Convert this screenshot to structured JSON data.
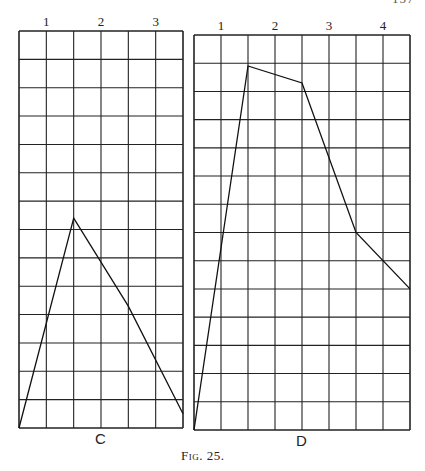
{
  "page": {
    "running_header_page_number": "157",
    "caption": "Fig. 25."
  },
  "chart_data": [
    {
      "type": "line",
      "title": "C",
      "xlabel": "",
      "ylabel": "",
      "grid": true,
      "grid_columns": 6,
      "grid_rows": 14,
      "x_tick_labels": [
        {
          "label": "1",
          "at": 1
        },
        {
          "label": "2",
          "at": 3
        },
        {
          "label": "3",
          "at": 5
        }
      ],
      "xlim": [
        0,
        6
      ],
      "ylim": [
        0,
        14
      ],
      "x": [
        0,
        2,
        4,
        6
      ],
      "values": [
        0,
        7.4,
        4.3,
        0.5
      ]
    },
    {
      "type": "line",
      "title": "D",
      "xlabel": "",
      "ylabel": "",
      "grid": true,
      "grid_columns": 8,
      "grid_rows": 14,
      "x_tick_labels": [
        {
          "label": "1",
          "at": 1
        },
        {
          "label": "2",
          "at": 3
        },
        {
          "label": "3",
          "at": 5
        },
        {
          "label": "4",
          "at": 7
        }
      ],
      "xlim": [
        0,
        8
      ],
      "ylim": [
        0,
        14
      ],
      "x": [
        0,
        2,
        4,
        6,
        8
      ],
      "values": [
        0,
        12.9,
        12.3,
        7.0,
        5.0
      ]
    }
  ]
}
